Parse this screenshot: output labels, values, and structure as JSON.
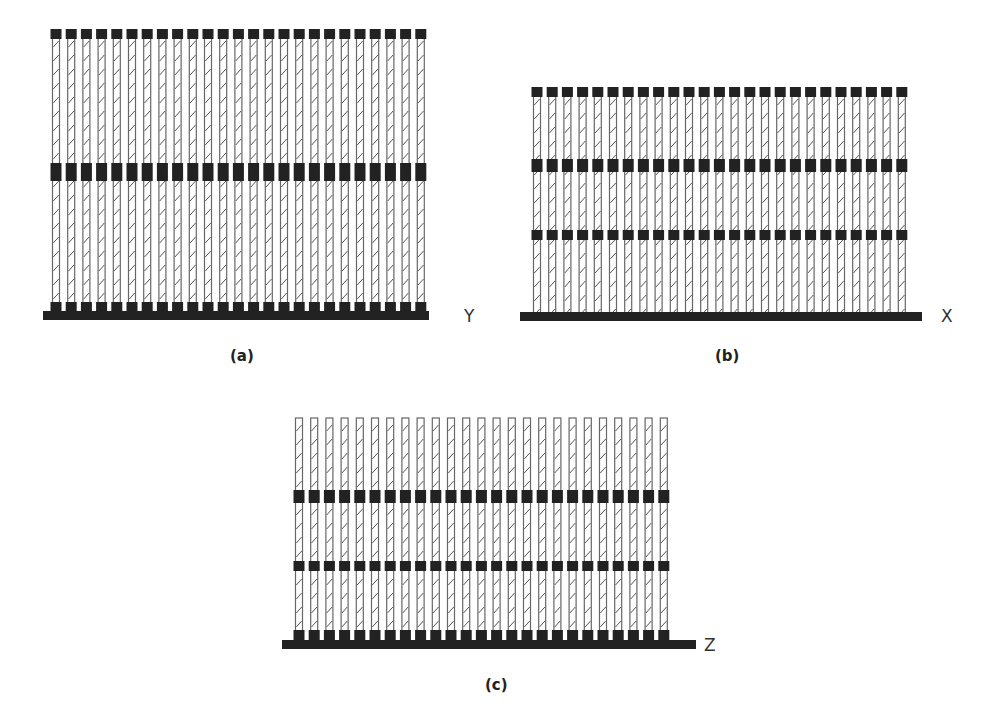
{
  "figure": {
    "colors": {
      "block": "#222222",
      "column_stroke": "#666666",
      "hatch": "#555555",
      "background": "#ffffff",
      "text": "#333333"
    },
    "panels": [
      {
        "id": "a",
        "caption": "(a)",
        "axis_label": "Y",
        "column_count": 25,
        "column_x_start": 56,
        "column_pitch": 15.2,
        "column_width": 7,
        "column_top": 34,
        "column_bottom": 312,
        "top_cap": "block",
        "bands": [
          {
            "y": 29,
            "height": 10,
            "width": 11
          },
          {
            "y": 163,
            "height": 18,
            "width": 11
          }
        ],
        "bottom_blocks": {
          "y": 302,
          "height": 11,
          "width": 11
        },
        "base": {
          "x": 43,
          "y": 311,
          "width": 386,
          "height": 9
        },
        "axis_label_pos": {
          "x": 464,
          "y": 322
        },
        "caption_pos": {
          "x": 230,
          "y": 361
        }
      },
      {
        "id": "b",
        "caption": "(b)",
        "axis_label": "X",
        "column_count": 25,
        "column_x_start": 537,
        "column_pitch": 15.2,
        "column_width": 7,
        "column_top": 92,
        "column_bottom": 313,
        "top_cap": "block",
        "bands": [
          {
            "y": 87,
            "height": 10,
            "width": 11
          },
          {
            "y": 159,
            "height": 13,
            "width": 11
          },
          {
            "y": 230,
            "height": 10,
            "width": 11
          }
        ],
        "bottom_blocks": null,
        "base": {
          "x": 520,
          "y": 312,
          "width": 402,
          "height": 9
        },
        "axis_label_pos": {
          "x": 941,
          "y": 322
        },
        "caption_pos": {
          "x": 715,
          "y": 361
        }
      },
      {
        "id": "c",
        "caption": "(c)",
        "axis_label": "Z",
        "column_count": 25,
        "column_x_start": 299,
        "column_pitch": 15.2,
        "column_width": 7,
        "column_top": 418,
        "column_bottom": 641,
        "top_cap": "open",
        "bands": [
          {
            "y": 490,
            "height": 13,
            "width": 11
          },
          {
            "y": 561,
            "height": 10,
            "width": 11
          }
        ],
        "bottom_blocks": {
          "y": 630,
          "height": 11,
          "width": 11
        },
        "base": {
          "x": 282,
          "y": 640,
          "width": 414,
          "height": 9
        },
        "axis_label_pos": {
          "x": 704,
          "y": 651
        },
        "caption_pos": {
          "x": 485,
          "y": 690
        }
      }
    ]
  }
}
